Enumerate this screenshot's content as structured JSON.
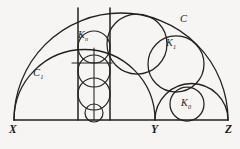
{
  "figure": {
    "background_color": "#f6f5f3",
    "ink_color": "#23201e"
  },
  "labels": {
    "point_x": "X",
    "point_y": "Y",
    "point_z": "Z",
    "outer_semicircle": "C",
    "inner_semicircle": "C",
    "inner_semicircle_sub": "1",
    "chain_circle_n": "K",
    "chain_circle_n_sub": "n",
    "chain_circle_1": "K",
    "chain_circle_1_sub": "1",
    "chain_circle_0": "K",
    "chain_circle_0_sub": "0"
  },
  "geometry": {
    "baseline": {
      "y": 120,
      "x_start": 14,
      "x_end": 228
    },
    "points": {
      "X": {
        "x": 14,
        "y": 120
      },
      "Y": {
        "x": 155,
        "y": 120
      },
      "Z": {
        "x": 228,
        "y": 120
      }
    },
    "semicircle_C": {
      "cx": 121,
      "cy": 120,
      "r": 107
    },
    "semicircle_C1": {
      "cx": 84.5,
      "cy": 120,
      "r": 70.5
    },
    "semicircle_YZ": {
      "cx": 191.5,
      "cy": 120,
      "r": 36.5
    },
    "vertical_lines": [
      {
        "name": "left-tangent",
        "x": 78,
        "y_top": 8,
        "y_bottom": 120
      },
      {
        "name": "center-axis",
        "x": 94,
        "y_top": 48,
        "y_bottom": 120
      },
      {
        "name": "right-tangent",
        "x": 110,
        "y_top": 8,
        "y_bottom": 120
      }
    ],
    "chain_circles": [
      {
        "name": "K0",
        "cx": 187,
        "cy": 104,
        "r": 17
      },
      {
        "name": "K1",
        "cx": 176,
        "cy": 64,
        "r": 28
      },
      {
        "name": "K2",
        "cx": 137,
        "cy": 44,
        "r": 30
      },
      {
        "name": "Kn",
        "cx": 94,
        "cy": 47,
        "r": 16
      }
    ],
    "strip_circles": [
      {
        "cx": 94,
        "cy": 47,
        "r": 16
      },
      {
        "cx": 94,
        "cy": 71,
        "r": 16
      },
      {
        "cx": 94,
        "cy": 94,
        "r": 16
      },
      {
        "cx": 94,
        "cy": 113,
        "r": 9
      }
    ]
  }
}
